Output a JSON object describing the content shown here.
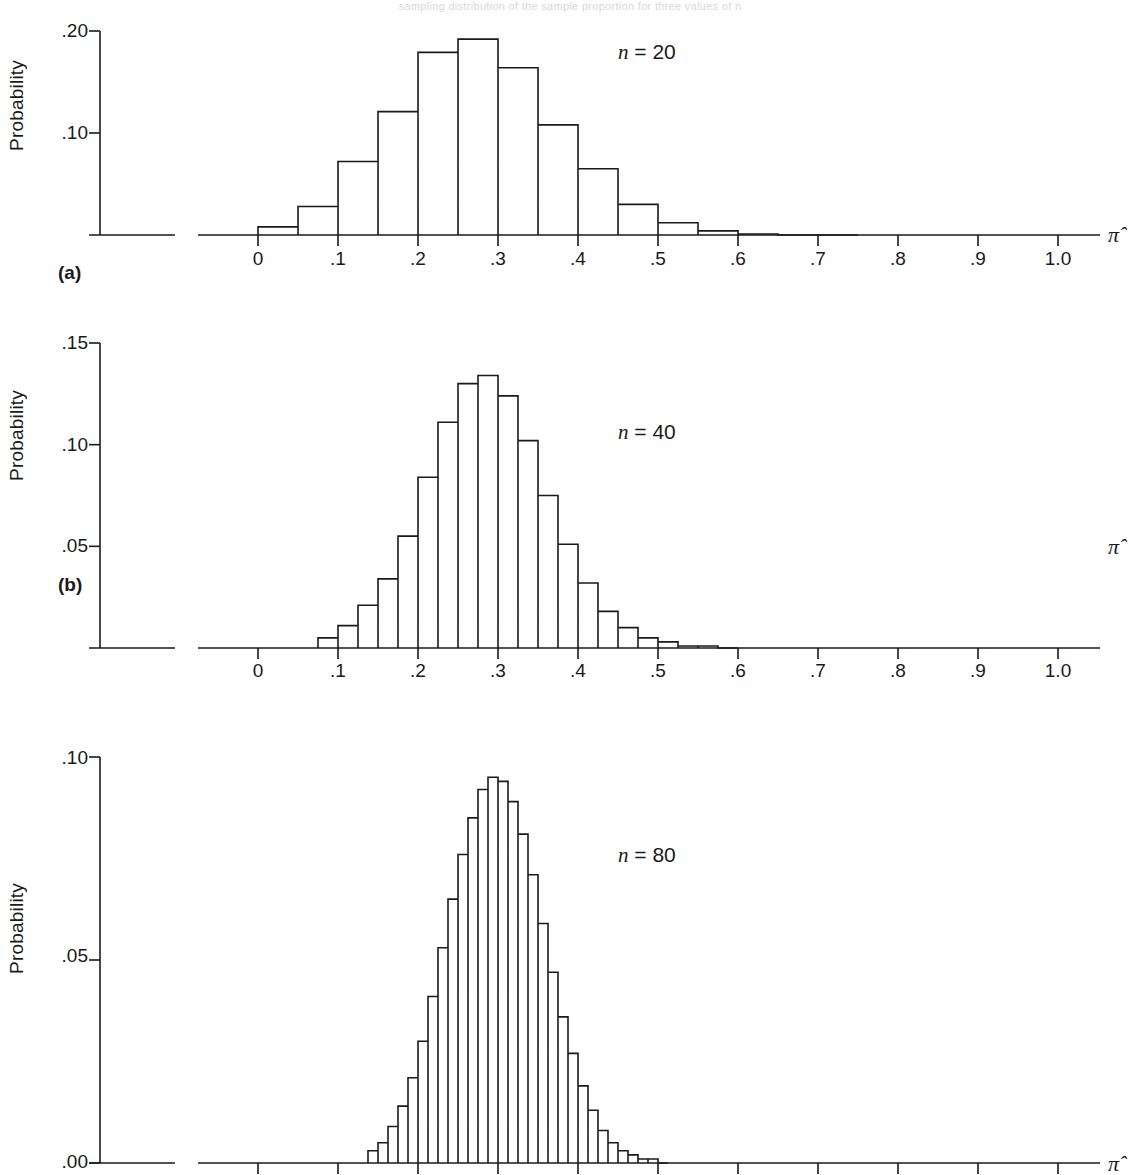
{
  "figure": {
    "caption_fragment": "sampling distribution of the sample proportion for three values of n",
    "pi_hat_symbol": "π̂",
    "axis_color": "#1a1a1a"
  },
  "chart_data": [
    {
      "type": "bar",
      "panel_label": "(a)",
      "annotation": "n = 20",
      "n": 20,
      "title": "",
      "xlabel": "π̂",
      "ylabel": "Probability",
      "xlim": [
        0,
        1.0
      ],
      "ylim": [
        0,
        0.2
      ],
      "grid": false,
      "xticks": [
        "0",
        ".1",
        ".2",
        ".3",
        ".4",
        ".5",
        ".6",
        ".7",
        ".8",
        ".9",
        "1.0"
      ],
      "xtick_values": [
        0,
        0.1,
        0.2,
        0.3,
        0.4,
        0.5,
        0.6,
        0.7,
        0.8,
        0.9,
        1.0
      ],
      "yticks": [
        ".10",
        ".20"
      ],
      "ytick_values": [
        0.1,
        0.2
      ],
      "bin_width": 0.05,
      "x": [
        0.0,
        0.05,
        0.1,
        0.15,
        0.2,
        0.25,
        0.3,
        0.35,
        0.4,
        0.45,
        0.5,
        0.55,
        0.6,
        0.65,
        0.7
      ],
      "values": [
        0.008,
        0.028,
        0.072,
        0.121,
        0.179,
        0.192,
        0.164,
        0.108,
        0.065,
        0.03,
        0.012,
        0.004,
        0.001,
        0.0,
        0.0
      ]
    },
    {
      "type": "bar",
      "panel_label": "(b)",
      "annotation": "n = 40",
      "n": 40,
      "title": "",
      "xlabel": "π̂",
      "ylabel": "Probability",
      "xlim": [
        0,
        1.0
      ],
      "ylim": [
        0,
        0.15
      ],
      "grid": false,
      "xticks": [
        "0",
        ".1",
        ".2",
        ".3",
        ".4",
        ".5",
        ".6",
        ".7",
        ".8",
        ".9",
        "1.0"
      ],
      "xtick_values": [
        0,
        0.1,
        0.2,
        0.3,
        0.4,
        0.5,
        0.6,
        0.7,
        0.8,
        0.9,
        1.0
      ],
      "yticks": [
        ".05",
        ".10",
        ".15"
      ],
      "ytick_values": [
        0.05,
        0.1,
        0.15
      ],
      "bin_width": 0.025,
      "x": [
        0.075,
        0.1,
        0.125,
        0.15,
        0.175,
        0.2,
        0.225,
        0.25,
        0.275,
        0.3,
        0.325,
        0.35,
        0.375,
        0.4,
        0.425,
        0.45,
        0.475,
        0.5,
        0.525,
        0.55,
        0.575
      ],
      "values": [
        0.005,
        0.011,
        0.021,
        0.034,
        0.055,
        0.084,
        0.111,
        0.13,
        0.134,
        0.124,
        0.102,
        0.075,
        0.051,
        0.032,
        0.018,
        0.01,
        0.005,
        0.003,
        0.001,
        0.001,
        0.0
      ]
    },
    {
      "type": "bar",
      "panel_label": "",
      "annotation": "n = 80",
      "n": 80,
      "title": "",
      "xlabel": "π̂",
      "ylabel": "Probability",
      "xlim": [
        0,
        1.0
      ],
      "ylim": [
        0,
        0.1
      ],
      "grid": false,
      "xticks": [
        "0",
        ".1",
        ".2",
        ".3",
        ".4",
        ".5",
        ".6",
        ".7",
        ".8",
        ".9",
        "1.0"
      ],
      "xtick_values": [
        0,
        0.1,
        0.2,
        0.3,
        0.4,
        0.5,
        0.6,
        0.7,
        0.8,
        0.9,
        1.0
      ],
      "yticks": [
        ".00",
        ".05",
        ".10"
      ],
      "ytick_values": [
        0.0,
        0.05,
        0.1
      ],
      "bin_width": 0.0125,
      "x": [
        0.1375,
        0.15,
        0.1625,
        0.175,
        0.1875,
        0.2,
        0.2125,
        0.225,
        0.2375,
        0.25,
        0.2625,
        0.275,
        0.2875,
        0.3,
        0.3125,
        0.325,
        0.3375,
        0.35,
        0.3625,
        0.375,
        0.3875,
        0.4,
        0.4125,
        0.425,
        0.4375,
        0.45,
        0.4625,
        0.475,
        0.4875,
        0.5
      ],
      "values": [
        0.003,
        0.005,
        0.009,
        0.014,
        0.021,
        0.03,
        0.041,
        0.053,
        0.065,
        0.076,
        0.085,
        0.092,
        0.095,
        0.094,
        0.089,
        0.081,
        0.071,
        0.059,
        0.047,
        0.036,
        0.027,
        0.019,
        0.013,
        0.008,
        0.005,
        0.003,
        0.002,
        0.001,
        0.001,
        0.0
      ]
    }
  ]
}
